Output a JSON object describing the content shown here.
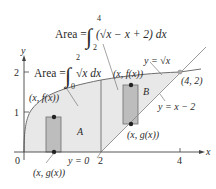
{
  "figure": {
    "axes": {
      "x_label": "x",
      "y_label": "y",
      "origin_label": "0",
      "x_ticks": [
        "2",
        "4"
      ],
      "y_ticks": [
        "1",
        "2"
      ]
    },
    "curves": {
      "upper": "y = √x",
      "lower": "y = x − 2",
      "baseline": "y = 0"
    },
    "regions": {
      "A": "A",
      "B": "B"
    },
    "formulas": {
      "area_A_prefix": "Area =",
      "area_A_lower": "0",
      "area_A_upper": "2",
      "area_A_integrand": "√x dx",
      "area_B_prefix": "Area =",
      "area_B_lower": "2",
      "area_B_upper": "4",
      "area_B_integrand": "(√x − x + 2) dx"
    },
    "points": {
      "intersection": "(4, 2)",
      "rect_A_top": "(x, f(x))",
      "rect_A_bottom": "(x, g(x))",
      "rect_B_top": "(x, f(x))",
      "rect_B_bottom": "(x, g(x))"
    },
    "colors": {
      "region_fill": "#e6e6e6",
      "rect_fill": "#b9b9b9",
      "curve": "#6e6e6e",
      "text": "#2a2a2a"
    }
  }
}
